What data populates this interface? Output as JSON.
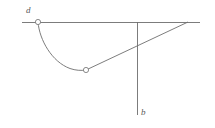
{
  "figure": {
    "background_color": "#ffffff",
    "stroke_color": "#6e6e6e",
    "marker_fill": "#ffffff",
    "labels": {
      "start_point": "d",
      "end_point": "b"
    },
    "geometry": {
      "view_width": 215,
      "view_height": 128,
      "baseline": {
        "type": "line",
        "x1": 22,
        "y1": 22,
        "x2": 200,
        "y2": 22
      },
      "vertical_axis": {
        "type": "line",
        "x1": 137,
        "y1": 22,
        "x2": 137,
        "y2": 115
      },
      "chord": {
        "type": "line",
        "x1": 86,
        "y1": 70,
        "x2": 188,
        "y2": 22
      },
      "curve": {
        "type": "path",
        "d": "M 38 22 C 39.5 40 52 62 70 68.5 C 75.5 70.4 81 70.8 86 70"
      },
      "markers": [
        {
          "name": "point-d",
          "cx": 38,
          "cy": 22,
          "r": 2.6
        },
        {
          "name": "point-c",
          "cx": 86,
          "cy": 70,
          "r": 2.6
        }
      ]
    }
  }
}
